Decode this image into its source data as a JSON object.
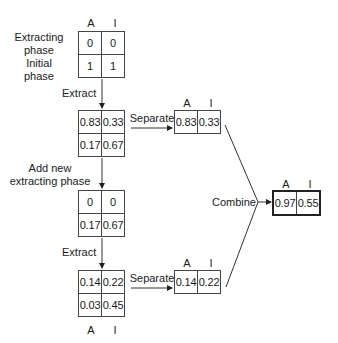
{
  "diagram": {
    "column_labels": [
      "A",
      "I"
    ],
    "row_labels": {
      "extracting_phase": "Extracting\nphase",
      "extracting_phase_line1": "Extracting",
      "extracting_phase_line2": "phase",
      "initial_phase_line1": "Initial",
      "initial_phase_line2": "phase"
    },
    "steps": {
      "extract_1": "Extract",
      "add_new_line1": "Add new",
      "add_new_line2": "extracting phase",
      "extract_2": "Extract",
      "separate_1": "Separate",
      "separate_2": "Separate",
      "combine": "Combine"
    },
    "tables": {
      "initial": {
        "rows": [
          [
            "0",
            "0"
          ],
          [
            "1",
            "1"
          ]
        ]
      },
      "after_extract_1": {
        "rows": [
          [
            "0.83",
            "0.33"
          ],
          [
            "0.17",
            "0.67"
          ]
        ]
      },
      "separated_1": {
        "rows": [
          [
            "0.83",
            "0.33"
          ]
        ]
      },
      "after_add_phase": {
        "rows": [
          [
            "0",
            "0"
          ],
          [
            "0.17",
            "0.67"
          ]
        ]
      },
      "after_extract_2": {
        "rows": [
          [
            "0.14",
            "0.22"
          ],
          [
            "0.03",
            "0.45"
          ]
        ]
      },
      "separated_2": {
        "rows": [
          [
            "0.14",
            "0.22"
          ]
        ]
      },
      "combined": {
        "rows": [
          [
            "0.97",
            "0.55"
          ]
        ]
      }
    }
  }
}
